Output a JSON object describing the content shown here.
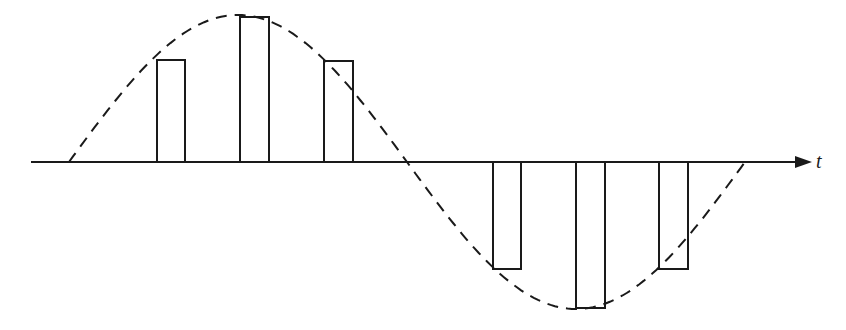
{
  "diagram": {
    "axis": {
      "label": "t"
    },
    "colors": {
      "stroke": "#1a1a1a",
      "background": "#ffffff"
    },
    "pulses": [
      {
        "x": 157,
        "width": 28,
        "top": 60,
        "bottom": 162,
        "polarity": "positive"
      },
      {
        "x": 240,
        "width": 29,
        "top": 17,
        "bottom": 162,
        "polarity": "positive"
      },
      {
        "x": 324,
        "width": 29,
        "top": 61,
        "bottom": 162,
        "polarity": "positive"
      },
      {
        "x": 493,
        "width": 28,
        "top": 162,
        "bottom": 269,
        "polarity": "negative"
      },
      {
        "x": 576,
        "width": 29,
        "top": 162,
        "bottom": 308,
        "polarity": "negative"
      },
      {
        "x": 659,
        "width": 29,
        "top": 162,
        "bottom": 269,
        "polarity": "negative"
      }
    ],
    "envelope": {
      "style": "dashed",
      "shape": "sine",
      "start_x": 69,
      "zero_cross_x": 407,
      "end_x": 745,
      "peak_y": 15,
      "trough_y": 309,
      "baseline_y": 162
    }
  }
}
